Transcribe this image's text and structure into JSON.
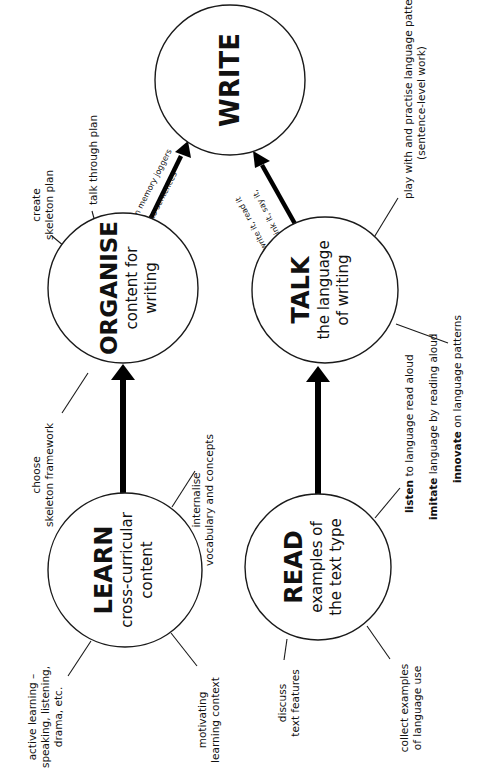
{
  "diagram": {
    "orientation": "rotated 90 degrees counter-clockwise",
    "colors": {
      "line": "#000000",
      "background": "#ffffff",
      "text": "#111111"
    },
    "nodes": {
      "write": {
        "title": "WRITE"
      },
      "organise": {
        "title": "ORGANISE",
        "line1": "content for",
        "line2": "writing"
      },
      "talk": {
        "title": "TALK",
        "line1": "the language",
        "line2": "of writing"
      },
      "learn": {
        "title": "LEARN",
        "line1": "cross-curricular",
        "line2": "content"
      },
      "read": {
        "title": "READ",
        "line1": "examples of",
        "line2": "the text type"
      }
    },
    "arrows": {
      "organise_to_write": {
        "label1": "turn memory joggers",
        "label2": "into sentences"
      },
      "talk_to_write": {
        "label1": "think it, say it,",
        "label2": "write it, read it"
      },
      "learn_to_organise": {},
      "read_to_talk": {}
    },
    "notes": {
      "organise": {
        "create_skeleton": {
          "line1": "create",
          "line2": "skeleton plan"
        },
        "talk_through": {
          "line1": "talk through plan"
        },
        "choose_framework": {
          "line1": "choose",
          "line2": "skeleton framework"
        }
      },
      "talk": {
        "play_with": {
          "line1": "play with and practise language patterns",
          "line2": "(sentence-level work)"
        },
        "listen": {
          "bold": "listen",
          "rest": " to language read aloud"
        },
        "imitate": {
          "bold": "imitate",
          "rest": " language by reading aloud"
        },
        "innovate": {
          "bold": "innovate",
          "rest": " on language patterns"
        }
      },
      "learn": {
        "active_learning": {
          "line1": "active learning –",
          "line2": "speaking, listening,",
          "line3": "drama, etc."
        },
        "motivating": {
          "line1": "motivating",
          "line2": "learning context"
        },
        "internalise": {
          "line1": "internalise",
          "line2": "vocabulary and concepts"
        }
      },
      "read": {
        "discuss": {
          "line1": "discuss",
          "line2": "text features"
        },
        "collect": {
          "line1": "collect examples",
          "line2": "of language use"
        }
      }
    }
  }
}
